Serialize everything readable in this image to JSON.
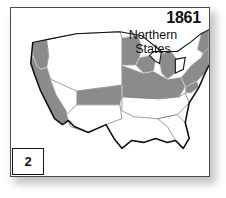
{
  "figure": {
    "number": "2",
    "year": "1861",
    "region_label_line1": "Northern",
    "region_label_line2": "States"
  },
  "colors": {
    "union_fill": "#8b8b8b",
    "confederate_fill": "#ffffff",
    "territory_fill": "#ffffff",
    "state_border": "#d6d6d6",
    "coast_outline": "#111111",
    "frame": "#4a4a4a",
    "text": "#111111"
  },
  "map": {
    "type": "choropleth",
    "subject": "United States 1861",
    "legend_note": "Shaded gray areas denote Northern (Union) states",
    "union_states": [
      "California",
      "Oregon",
      "Minnesota",
      "Wisconsin",
      "Michigan",
      "Iowa",
      "Illinois",
      "Indiana",
      "Ohio",
      "Pennsylvania",
      "New York",
      "Maine",
      "Vermont",
      "New Hampshire",
      "Massachusetts",
      "Rhode Island",
      "Connecticut",
      "New Jersey",
      "Delaware",
      "Maryland",
      "Kansas",
      "Nebraska Territory"
    ],
    "non_union_states": [
      "Texas",
      "Louisiana",
      "Arkansas",
      "Missouri",
      "Mississippi",
      "Alabama",
      "Georgia",
      "Florida",
      "South Carolina",
      "North Carolina",
      "Tennessee",
      "Kentucky",
      "Virginia",
      "New Mexico Territory",
      "Utah Territory",
      "Nevada Territory",
      "Washington Territory",
      "Dakota Territory",
      "Nebraska",
      "Indian Territory"
    ]
  }
}
